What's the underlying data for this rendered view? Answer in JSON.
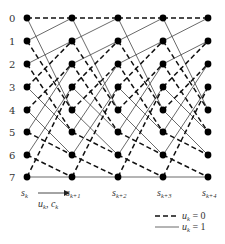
{
  "diagram": {
    "type": "trellis",
    "states": [
      "0",
      "1",
      "2",
      "3",
      "4",
      "5",
      "6",
      "7"
    ],
    "stages": [
      {
        "base": "s",
        "sub": "k"
      },
      {
        "base": "s",
        "sub": "k+1"
      },
      {
        "base": "s",
        "sub": "k+2"
      },
      {
        "base": "s",
        "sub": "k+3"
      },
      {
        "base": "s",
        "sub": "k+4"
      }
    ],
    "transition_label": {
      "base1": "u",
      "sub1": "k",
      "sep": ", ",
      "base2": "c",
      "sub2": "k"
    },
    "transitions": [
      {
        "from": 0,
        "to": 0,
        "u": 0
      },
      {
        "from": 0,
        "to": 4,
        "u": 1
      },
      {
        "from": 1,
        "to": 0,
        "u": 1
      },
      {
        "from": 1,
        "to": 4,
        "u": 0
      },
      {
        "from": 2,
        "to": 1,
        "u": 1
      },
      {
        "from": 2,
        "to": 5,
        "u": 0
      },
      {
        "from": 3,
        "to": 1,
        "u": 0
      },
      {
        "from": 3,
        "to": 5,
        "u": 1
      },
      {
        "from": 4,
        "to": 2,
        "u": 0
      },
      {
        "from": 4,
        "to": 6,
        "u": 1
      },
      {
        "from": 5,
        "to": 2,
        "u": 1
      },
      {
        "from": 5,
        "to": 6,
        "u": 0
      },
      {
        "from": 6,
        "to": 3,
        "u": 1
      },
      {
        "from": 6,
        "to": 7,
        "u": 0
      },
      {
        "from": 7,
        "to": 3,
        "u": 0
      },
      {
        "from": 7,
        "to": 7,
        "u": 1
      }
    ],
    "legend": [
      {
        "style": "dashed",
        "base": "u",
        "sub": "k",
        "text": " = 0"
      },
      {
        "style": "solid",
        "base": "u",
        "sub": "k",
        "text": " = 1"
      }
    ],
    "colors": {
      "node": "#000000",
      "dashed": "#111111",
      "solid": "#444444",
      "text": "#333333"
    }
  }
}
